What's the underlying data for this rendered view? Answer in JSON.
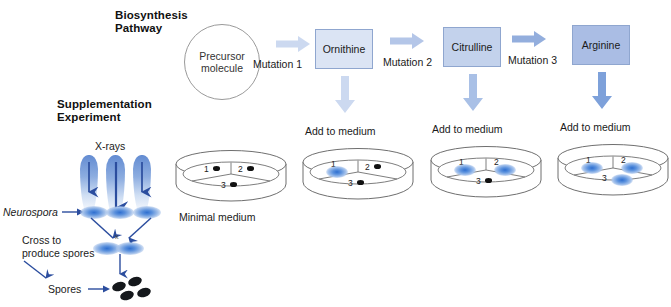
{
  "figure": {
    "title_top": "Biosynthesis\nPathway",
    "title_bottom": "Supplementation\nExperiment"
  },
  "pathway": {
    "precursor_label": "Precursor\nmolecule",
    "steps": [
      {
        "mutation": "Mutation 1",
        "product": "Ornithine",
        "box_fill": "#dbe4f4",
        "box_border": "#8fa6cf",
        "arrow_color": "#ccd9f0"
      },
      {
        "mutation": "Mutation 2",
        "product": "Citrulline",
        "box_fill": "#c3d2ec",
        "box_border": "#8fa6cf",
        "arrow_color": "#b4c6e8"
      },
      {
        "mutation": "Mutation 3",
        "product": "Arginine",
        "box_fill": "#aabde4",
        "box_border": "#8fa6cf",
        "arrow_color": "#93aedd"
      }
    ],
    "down_arrow_colors": [
      "#ccd9f0",
      "#a9c0e6",
      "#7ea1da"
    ]
  },
  "experiment": {
    "xrays_label": "X-rays",
    "neurospora_label": "Neurospora",
    "cross_label": "Cross to\nproduce spores",
    "spores_label": "Spores",
    "cross_x": "x"
  },
  "dishes": [
    {
      "caption": "Minimal medium",
      "caption_position": "below",
      "sectors": [
        {
          "num": "1",
          "growth": false
        },
        {
          "num": "2",
          "growth": false
        },
        {
          "num": "3",
          "growth": false
        }
      ]
    },
    {
      "caption": "Add to medium",
      "caption_position": "above",
      "sectors": [
        {
          "num": "1",
          "growth": true
        },
        {
          "num": "2",
          "growth": false
        },
        {
          "num": "3",
          "growth": false
        }
      ]
    },
    {
      "caption": "Add to medium",
      "caption_position": "above",
      "sectors": [
        {
          "num": "1",
          "growth": true
        },
        {
          "num": "2",
          "growth": true
        },
        {
          "num": "3",
          "growth": false
        }
      ]
    },
    {
      "caption": "Add to medium",
      "caption_position": "above",
      "sectors": [
        {
          "num": "1",
          "growth": true
        },
        {
          "num": "2",
          "growth": true
        },
        {
          "num": "3",
          "growth": true
        }
      ]
    }
  ],
  "colors": {
    "dish_outline": "#6f6f6f",
    "growth_blue": "#2f6fd0",
    "no_growth_dot": "#111111",
    "arrow_dark": "#2b4d9e"
  }
}
